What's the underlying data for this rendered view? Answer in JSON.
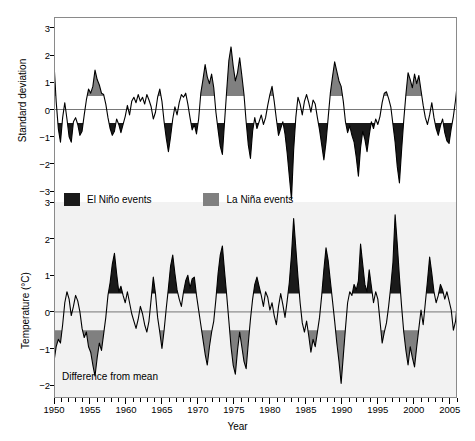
{
  "figure": {
    "xlabel": "Year",
    "background": "#ffffff",
    "lower_panel_background": "#f2f2f2",
    "elnino_color": "#1a1a1a",
    "lanina_color": "#808080",
    "line_color": "#000000"
  },
  "legend": {
    "position": "between-panels",
    "items": [
      {
        "label": "El Niño events",
        "color": "#1a1a1a",
        "swatch": "elnino-swatch"
      },
      {
        "label": "La Niña events",
        "color": "#808080",
        "swatch": "lanina-swatch"
      }
    ]
  },
  "xaxis": {
    "label": "Year",
    "min": 1950,
    "max": 2006,
    "major_ticks": [
      1950,
      1955,
      1960,
      1965,
      1970,
      1975,
      1980,
      1985,
      1990,
      1995,
      2000,
      2005
    ],
    "tick_labels": [
      "1950",
      "1955",
      "1960",
      "1965",
      "1970",
      "1975",
      "1980",
      "1985",
      "1990",
      "1995",
      "2000",
      "2005"
    ],
    "minor_tick_interval": 1
  },
  "upper_panel": {
    "ylabel": "Standard deviation",
    "ytick_labels": [
      "3",
      "2",
      "1",
      "0",
      "−1",
      "−2",
      "−3"
    ],
    "yticks": [
      3,
      2,
      1,
      0,
      -1,
      -2,
      -3
    ],
    "ylim": [
      -3.4,
      3.4
    ],
    "threshold_positive": 0.5,
    "threshold_negative": -0.5,
    "fill_note": "negative beyond -0.5 filled dark (El Niño); positive beyond +0.5 filled gray (La Niña)"
  },
  "lower_panel": {
    "ylabel": "Temperature (°C)",
    "ytick_labels": [
      "3",
      "2",
      "1",
      "0",
      "−1",
      "−2"
    ],
    "yticks": [
      3,
      2,
      1,
      0,
      -1,
      -2
    ],
    "ylim": [
      -2.35,
      3.0
    ],
    "annotation": "Difference from mean",
    "threshold_positive": 0.5,
    "threshold_negative": -0.5,
    "fill_note": "positive beyond +0.5 filled dark (El Niño); negative beyond -0.5 filled gray (La Niña)"
  },
  "chart_data": [
    {
      "type": "area",
      "name": "southern-oscillation-index",
      "title": "",
      "xlabel": "Year",
      "ylabel": "Standard deviation",
      "ylim": [
        -3.4,
        3.4
      ],
      "xlim": [
        1950,
        2006
      ],
      "grid": false,
      "legend_position": "below-panel",
      "x": [
        1950.0,
        1950.3,
        1950.6,
        1950.9,
        1951.2,
        1951.5,
        1951.8,
        1952.1,
        1952.4,
        1952.7,
        1953.0,
        1953.3,
        1953.6,
        1953.9,
        1954.2,
        1954.5,
        1954.8,
        1955.1,
        1955.4,
        1955.7,
        1956.0,
        1956.3,
        1956.6,
        1956.9,
        1957.2,
        1957.5,
        1957.8,
        1958.1,
        1958.4,
        1958.7,
        1959.0,
        1959.3,
        1959.6,
        1959.9,
        1960.2,
        1960.5,
        1960.8,
        1961.1,
        1961.4,
        1961.7,
        1962.0,
        1962.3,
        1962.6,
        1962.9,
        1963.2,
        1963.5,
        1963.8,
        1964.1,
        1964.4,
        1964.7,
        1965.0,
        1965.3,
        1965.6,
        1965.9,
        1966.2,
        1966.5,
        1966.8,
        1967.1,
        1967.4,
        1967.7,
        1968.0,
        1968.3,
        1968.6,
        1968.9,
        1969.2,
        1969.5,
        1969.8,
        1970.1,
        1970.4,
        1970.7,
        1971.0,
        1971.3,
        1971.6,
        1971.9,
        1972.2,
        1972.5,
        1972.8,
        1973.1,
        1973.4,
        1973.7,
        1974.0,
        1974.3,
        1974.6,
        1974.9,
        1975.2,
        1975.5,
        1975.8,
        1976.1,
        1976.4,
        1976.7,
        1977.0,
        1977.3,
        1977.6,
        1977.9,
        1978.2,
        1978.5,
        1978.8,
        1979.1,
        1979.4,
        1979.7,
        1980.0,
        1980.3,
        1980.6,
        1980.9,
        1981.2,
        1981.5,
        1981.8,
        1982.1,
        1982.4,
        1982.7,
        1983.0,
        1983.3,
        1983.6,
        1983.9,
        1984.2,
        1984.5,
        1984.8,
        1985.1,
        1985.4,
        1985.7,
        1986.0,
        1986.3,
        1986.6,
        1986.9,
        1987.2,
        1987.5,
        1987.8,
        1988.1,
        1988.4,
        1988.7,
        1989.0,
        1989.3,
        1989.6,
        1989.9,
        1990.2,
        1990.5,
        1990.8,
        1991.1,
        1991.4,
        1991.7,
        1992.0,
        1992.3,
        1992.6,
        1992.9,
        1993.2,
        1993.5,
        1993.8,
        1994.1,
        1994.4,
        1994.7,
        1995.0,
        1995.3,
        1995.6,
        1995.9,
        1996.2,
        1996.5,
        1996.8,
        1997.1,
        1997.4,
        1997.7,
        1998.0,
        1998.3,
        1998.6,
        1998.9,
        1999.2,
        1999.5,
        1999.8,
        2000.1,
        2000.4,
        2000.7,
        2001.0,
        2001.3,
        2001.6,
        2001.9,
        2002.2,
        2002.5,
        2002.8,
        2003.1,
        2003.4,
        2003.7,
        2004.0,
        2004.3,
        2004.6,
        2004.9,
        2005.2,
        2005.5,
        2005.8,
        2006.0
      ],
      "values": [
        1.7,
        0.3,
        -0.7,
        -1.2,
        -0.3,
        0.25,
        -0.35,
        -1.0,
        -1.2,
        -0.45,
        -0.3,
        -0.55,
        -0.95,
        -0.8,
        -0.2,
        0.35,
        0.75,
        0.6,
        0.85,
        1.45,
        1.1,
        0.9,
        0.6,
        0.55,
        0.2,
        -0.3,
        -0.7,
        -0.95,
        -0.8,
        -0.35,
        -0.55,
        -0.85,
        -0.55,
        -0.25,
        0.15,
        -0.2,
        0.3,
        0.45,
        0.25,
        0.55,
        0.3,
        0.45,
        0.2,
        0.55,
        0.35,
        0.1,
        -0.35,
        -0.1,
        0.45,
        0.75,
        0.3,
        -0.45,
        -1.05,
        -1.55,
        -1.0,
        -0.35,
        0.1,
        -0.2,
        0.25,
        0.55,
        0.45,
        0.6,
        0.2,
        -0.3,
        -0.75,
        -0.55,
        -0.9,
        -0.35,
        0.6,
        1.1,
        1.65,
        1.2,
        0.95,
        1.3,
        0.8,
        -0.1,
        -0.75,
        -1.35,
        -1.65,
        -0.45,
        0.7,
        1.8,
        2.3,
        1.6,
        1.05,
        1.35,
        1.9,
        1.25,
        0.55,
        -0.45,
        -1.3,
        -1.8,
        -0.8,
        -0.3,
        -0.7,
        -0.45,
        -0.2,
        -0.55,
        -0.3,
        0.15,
        0.55,
        0.85,
        0.3,
        -0.35,
        -0.95,
        -0.7,
        -0.45,
        -0.9,
        -1.6,
        -2.45,
        -3.3,
        -1.5,
        -0.3,
        0.45,
        0.2,
        -0.2,
        0.3,
        0.55,
        0.25,
        -0.1,
        0.35,
        0.2,
        -0.3,
        -0.75,
        -1.3,
        -1.85,
        -1.2,
        -0.3,
        0.6,
        1.2,
        1.75,
        1.4,
        1.05,
        0.85,
        0.3,
        -0.45,
        -0.85,
        -0.6,
        -0.95,
        -1.2,
        -1.75,
        -2.45,
        -1.4,
        -0.8,
        -1.1,
        -1.55,
        -0.95,
        -0.45,
        -0.7,
        -0.35,
        -0.55,
        -0.25,
        0.25,
        0.6,
        0.65,
        0.4,
        0.1,
        -0.55,
        -1.2,
        -2.1,
        -2.7,
        -1.5,
        -0.4,
        0.55,
        1.35,
        1.1,
        0.8,
        1.3,
        0.95,
        1.25,
        0.7,
        0.15,
        -0.3,
        -0.55,
        -0.2,
        0.25,
        -0.3,
        -0.7,
        -0.95,
        -0.6,
        -0.35,
        -0.85,
        -1.15,
        -1.25,
        -0.7,
        -0.25,
        0.35,
        0.85,
        0.25,
        -0.45,
        -1.05
      ],
      "annotations": []
    },
    {
      "type": "area",
      "name": "temperature-difference-from-mean",
      "title": "",
      "xlabel": "Year",
      "ylabel": "Temperature (°C)",
      "ylim": [
        -2.35,
        3.0
      ],
      "xlim": [
        1950,
        2006
      ],
      "grid": false,
      "legend_position": "above-panel",
      "x": [
        1950.0,
        1950.3,
        1950.6,
        1950.9,
        1951.2,
        1951.5,
        1951.8,
        1952.1,
        1952.4,
        1952.7,
        1953.0,
        1953.3,
        1953.6,
        1953.9,
        1954.2,
        1954.5,
        1954.8,
        1955.1,
        1955.4,
        1955.7,
        1956.0,
        1956.3,
        1956.6,
        1956.9,
        1957.2,
        1957.5,
        1957.8,
        1958.1,
        1958.4,
        1958.7,
        1959.0,
        1959.3,
        1959.6,
        1959.9,
        1960.2,
        1960.5,
        1960.8,
        1961.1,
        1961.4,
        1961.7,
        1962.0,
        1962.3,
        1962.6,
        1962.9,
        1963.2,
        1963.5,
        1963.8,
        1964.1,
        1964.4,
        1964.7,
        1965.0,
        1965.3,
        1965.6,
        1965.9,
        1966.2,
        1966.5,
        1966.8,
        1967.1,
        1967.4,
        1967.7,
        1968.0,
        1968.3,
        1968.6,
        1968.9,
        1969.2,
        1969.5,
        1969.8,
        1970.1,
        1970.4,
        1970.7,
        1971.0,
        1971.3,
        1971.6,
        1971.9,
        1972.2,
        1972.5,
        1972.8,
        1973.1,
        1973.4,
        1973.7,
        1974.0,
        1974.3,
        1974.6,
        1974.9,
        1975.2,
        1975.5,
        1975.8,
        1976.1,
        1976.4,
        1976.7,
        1977.0,
        1977.3,
        1977.6,
        1977.9,
        1978.2,
        1978.5,
        1978.8,
        1979.1,
        1979.4,
        1979.7,
        1980.0,
        1980.3,
        1980.6,
        1980.9,
        1981.2,
        1981.5,
        1981.8,
        1982.1,
        1982.4,
        1982.7,
        1983.0,
        1983.3,
        1983.6,
        1983.9,
        1984.2,
        1984.5,
        1984.8,
        1985.1,
        1985.4,
        1985.7,
        1986.0,
        1986.3,
        1986.6,
        1986.9,
        1987.2,
        1987.5,
        1987.8,
        1988.1,
        1988.4,
        1988.7,
        1989.0,
        1989.3,
        1989.6,
        1989.9,
        1990.2,
        1990.5,
        1990.8,
        1991.1,
        1991.4,
        1991.7,
        1992.0,
        1992.3,
        1992.6,
        1992.9,
        1993.2,
        1993.5,
        1993.8,
        1994.1,
        1994.4,
        1994.7,
        1995.0,
        1995.3,
        1995.6,
        1995.9,
        1996.2,
        1996.5,
        1996.8,
        1997.1,
        1997.4,
        1997.7,
        1998.0,
        1998.3,
        1998.6,
        1998.9,
        1999.2,
        1999.5,
        1999.8,
        2000.1,
        2000.4,
        2000.7,
        2001.0,
        2001.3,
        2001.6,
        2001.9,
        2002.2,
        2002.5,
        2002.8,
        2003.1,
        2003.4,
        2003.7,
        2004.0,
        2004.3,
        2004.6,
        2004.9,
        2005.2,
        2005.5,
        2005.8,
        2006.0
      ],
      "values": [
        -1.35,
        -0.95,
        -0.75,
        -0.85,
        -0.35,
        0.25,
        0.55,
        0.35,
        -0.1,
        0.15,
        0.45,
        0.3,
        0.0,
        -0.45,
        -0.7,
        -0.55,
        -0.95,
        -1.1,
        -1.45,
        -1.75,
        -1.25,
        -0.85,
        -1.05,
        -0.6,
        -0.15,
        0.45,
        0.8,
        1.3,
        1.6,
        1.05,
        0.55,
        0.7,
        0.45,
        0.25,
        0.55,
        0.25,
        -0.05,
        -0.25,
        -0.45,
        -0.2,
        0.15,
        -0.05,
        -0.35,
        -0.55,
        -0.25,
        0.35,
        0.95,
        0.5,
        -0.15,
        -0.55,
        -1.0,
        -0.5,
        0.1,
        0.65,
        1.25,
        1.55,
        1.05,
        0.6,
        0.35,
        0.15,
        0.55,
        0.85,
        1.0,
        0.65,
        0.9,
        0.95,
        0.45,
        0.05,
        -0.35,
        -0.75,
        -1.15,
        -1.45,
        -0.95,
        -0.55,
        -0.25,
        0.35,
        1.05,
        1.55,
        1.8,
        1.1,
        0.45,
        -0.25,
        -0.95,
        -1.45,
        -1.7,
        -1.05,
        -0.55,
        -0.95,
        -1.35,
        -1.55,
        -0.85,
        -0.2,
        0.35,
        0.75,
        0.95,
        0.7,
        0.45,
        0.15,
        0.55,
        0.4,
        0.05,
        0.25,
        -0.1,
        -0.35,
        0.15,
        0.5,
        0.2,
        -0.15,
        0.3,
        0.8,
        1.55,
        2.55,
        1.75,
        0.95,
        0.25,
        -0.3,
        -0.55,
        -0.25,
        -0.65,
        -1.1,
        -0.75,
        -0.95,
        -0.55,
        -0.15,
        0.45,
        1.15,
        1.75,
        1.4,
        0.85,
        0.3,
        -0.25,
        -0.85,
        -1.35,
        -1.95,
        -1.2,
        -0.45,
        0.25,
        0.55,
        0.45,
        0.75,
        0.6,
        0.85,
        1.85,
        1.3,
        0.75,
        0.55,
        1.15,
        0.7,
        0.25,
        0.55,
        0.35,
        -0.25,
        -0.85,
        -0.55,
        -0.3,
        0.15,
        0.7,
        1.35,
        2.65,
        1.85,
        0.95,
        0.15,
        -0.55,
        -1.05,
        -1.45,
        -0.95,
        -1.25,
        -1.5,
        -0.95,
        -0.45,
        0.05,
        -0.35,
        0.25,
        0.85,
        1.5,
        1.05,
        0.55,
        0.25,
        0.45,
        0.75,
        0.6,
        0.35,
        0.55,
        0.3,
        0.05,
        -0.5,
        -0.25,
        0.15,
        0.45
      ],
      "annotations": [
        {
          "text": "Difference from mean",
          "x": 1951,
          "y": -2.0
        }
      ]
    }
  ]
}
